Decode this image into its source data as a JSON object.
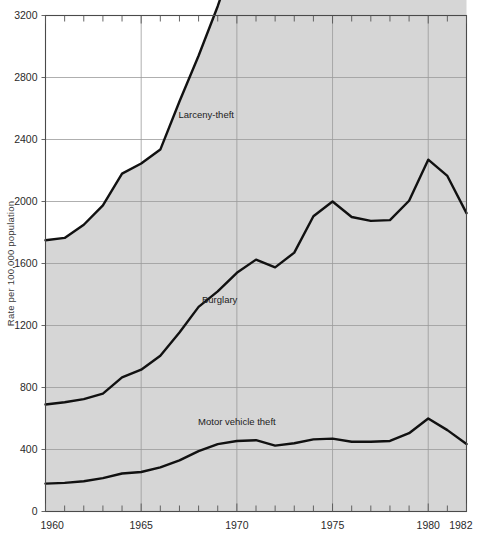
{
  "chart_data": {
    "type": "area",
    "title": "",
    "subtitle": "",
    "xlabel": "",
    "ylabel": "Rate per 100,000 population",
    "stacked": true,
    "grid": true,
    "legend_position": "inline-annotations",
    "xlim": [
      1960,
      1982
    ],
    "ylim": [
      0,
      3200
    ],
    "ytick_values": [
      0,
      400,
      800,
      1200,
      1600,
      2000,
      2400,
      2800,
      3200
    ],
    "ytick_labels": [
      "0",
      "400",
      "800",
      "1200",
      "1600",
      "2000",
      "2400",
      "2800",
      "3200"
    ],
    "xtick_values": [
      1960,
      1965,
      1970,
      1975,
      1980,
      1982
    ],
    "xtick_labels": [
      "1960",
      "1965",
      "1970",
      "1975",
      "1980",
      "1982"
    ],
    "x_minor_ticks": [
      1961,
      1962,
      1963,
      1964,
      1966,
      1967,
      1968,
      1969,
      1971,
      1972,
      1973,
      1974,
      1976,
      1977,
      1978,
      1979,
      1981
    ],
    "x_gridlines": [
      1965,
      1970,
      1975,
      1980
    ],
    "x": [
      1960,
      1961,
      1962,
      1963,
      1964,
      1965,
      1966,
      1967,
      1968,
      1969,
      1970,
      1971,
      1972,
      1973,
      1974,
      1975,
      1976,
      1977,
      1978,
      1979,
      1980,
      1981,
      1982
    ],
    "series": [
      {
        "name": "Motor vehicle theft",
        "label": "Motor vehicle theft",
        "values": [
          180,
          185,
          195,
          215,
          245,
          255,
          285,
          330,
          390,
          435,
          455,
          460,
          425,
          440,
          465,
          470,
          450,
          450,
          455,
          505,
          600,
          525,
          435
        ],
        "label_x": 1970.0,
        "label_y": 560
      },
      {
        "name": "Burglary",
        "label": "Burglary",
        "values": [
          510,
          520,
          530,
          545,
          620,
          660,
          720,
          825,
          930,
          985,
          1085,
          1165,
          1150,
          1230,
          1440,
          1530,
          1450,
          1425,
          1425,
          1500,
          1670,
          1640,
          1490
        ],
        "label_x": 1969.1,
        "label_y": 1345
      },
      {
        "name": "Larceny-theft",
        "label": "Larceny-theft",
        "values": [
          1060,
          1060,
          1125,
          1215,
          1315,
          1330,
          1330,
          1490,
          1620,
          1840,
          2080,
          2120,
          2010,
          2060,
          2490,
          2810,
          2910,
          2740,
          2740,
          2990,
          3110,
          3080,
          3000
        ],
        "label_x": 1968.4,
        "label_y": 2540
      }
    ],
    "colors": {
      "fill": "#d6d6d6",
      "line": "#111111",
      "grid": "#9a9a9a",
      "axis": "#555555",
      "text": "#222222",
      "background": "#ffffff"
    }
  }
}
